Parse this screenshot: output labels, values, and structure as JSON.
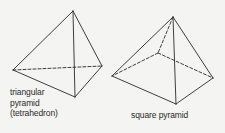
{
  "shapes": {
    "triangular": {
      "label_line1": "triangular",
      "label_line2": "pyramid",
      "label_line3": "(tetrahedron)"
    },
    "square": {
      "label": "square pyramid"
    }
  },
  "colors": {
    "background": "#f4f4f2",
    "stroke": "#2a2a2a"
  }
}
